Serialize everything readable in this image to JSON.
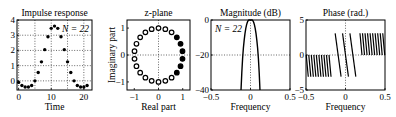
{
  "chart_data": [
    {
      "type": "scatter",
      "title": "Impulse response",
      "xlabel": "Time",
      "ylabel": "",
      "annotation": "N = 22",
      "xlim": [
        -0.5,
        22.5
      ],
      "ylim": [
        -0.6,
        4
      ],
      "xticks": [
        0,
        10,
        20
      ],
      "yticks": [
        0,
        1,
        2,
        3,
        4
      ],
      "grid": true,
      "x": [
        0,
        1,
        2,
        3,
        4,
        5,
        6,
        7,
        8,
        9,
        10,
        11,
        12,
        13,
        14,
        15,
        16,
        17,
        18,
        19,
        20,
        21
      ],
      "y": [
        -0.1,
        -0.3,
        -0.4,
        -0.4,
        -0.3,
        0.0,
        0.55,
        1.25,
        2.05,
        2.9,
        3.45,
        3.6,
        3.45,
        2.9,
        2.05,
        1.25,
        0.55,
        0.0,
        -0.3,
        -0.4,
        -0.4,
        -0.3
      ]
    },
    {
      "type": "scatter",
      "title": "z-plane",
      "xlabel": "Real part",
      "ylabel": "Imaginary part",
      "xlim": [
        -1.3,
        1.3
      ],
      "ylim": [
        -1.3,
        1.3
      ],
      "xticks": [
        -1,
        0,
        1
      ],
      "yticks": [
        -1,
        0,
        1
      ],
      "grid": true,
      "points_count": 22,
      "filled_count": 5,
      "marker": "circle"
    },
    {
      "type": "line",
      "title": "Magnitude (dB)",
      "xlabel": "Frequency",
      "ylabel": "",
      "annotation": "N = 22",
      "xlim": [
        -0.5,
        0.5
      ],
      "ylim": [
        -40,
        0
      ],
      "xticks": [
        -0.5,
        0,
        0.5
      ],
      "yticks": [
        -40,
        -20,
        0
      ],
      "grid": true,
      "x": [
        -0.12,
        -0.11,
        -0.1,
        -0.09,
        -0.08,
        -0.07,
        -0.06,
        -0.05,
        -0.04,
        -0.03,
        -0.02,
        -0.01,
        0,
        0.01,
        0.02,
        0.03,
        0.04,
        0.05,
        0.06,
        0.07,
        0.08,
        0.09,
        0.1,
        0.11,
        0.12
      ],
      "y": [
        -40,
        -30,
        -22,
        -16,
        -11.5,
        -7.8,
        -4.9,
        -2.8,
        -1.3,
        -0.4,
        0,
        0,
        0,
        0,
        0,
        -0.4,
        -1.3,
        -2.8,
        -4.9,
        -7.8,
        -11.5,
        -16,
        -22,
        -30,
        -40
      ]
    },
    {
      "type": "line",
      "title": "Phase (rad.)",
      "xlabel": "Frequency",
      "ylabel": "",
      "xlim": [
        -0.5,
        0.5
      ],
      "ylim": [
        -5,
        5
      ],
      "xticks": [
        -0.5,
        0,
        0.5
      ],
      "yticks": [
        -5,
        0,
        5
      ],
      "grid": true,
      "segments": [
        {
          "x_start": -0.5,
          "x_end": -0.18,
          "y_top": 0,
          "y_bottom": -3.1,
          "count": 10
        },
        {
          "x_start": -0.14,
          "x_end": 0.14,
          "y_top": 3.1,
          "y_bottom": -3.1,
          "count": 3
        },
        {
          "x_start": 0.18,
          "x_end": 0.5,
          "y_top": 3.1,
          "y_bottom": 0,
          "count": 10
        }
      ]
    }
  ]
}
